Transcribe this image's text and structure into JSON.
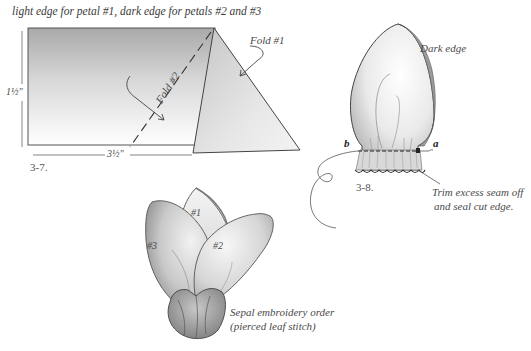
{
  "figure_3_7": {
    "caption": "light edge for petal #1, dark edge for petals #2 and #3",
    "height_dim": "1½\"",
    "width_dim": "3½\"",
    "fold1_label": "Fold #1",
    "fold2_label": "Fold #2",
    "figure_number": "3-7."
  },
  "figure_3_8": {
    "dark_edge_label": "Dark edge",
    "point_a": "a",
    "point_b": "b",
    "figure_number": "3-8.",
    "trim_note_line1": "Trim excess seam off",
    "trim_note_line2": "and seal cut edge."
  },
  "sepal_figure": {
    "petal_1": "#1",
    "petal_2": "#2",
    "petal_3": "#3",
    "note_line1": "Sepal embroidery order",
    "note_line2": "(pierced leaf stitch)"
  },
  "colors": {
    "line": "#3a3a3a",
    "shade_dark": "#9a9a9a",
    "shade_light": "#f2f2f2",
    "paper": "#ffffff"
  }
}
